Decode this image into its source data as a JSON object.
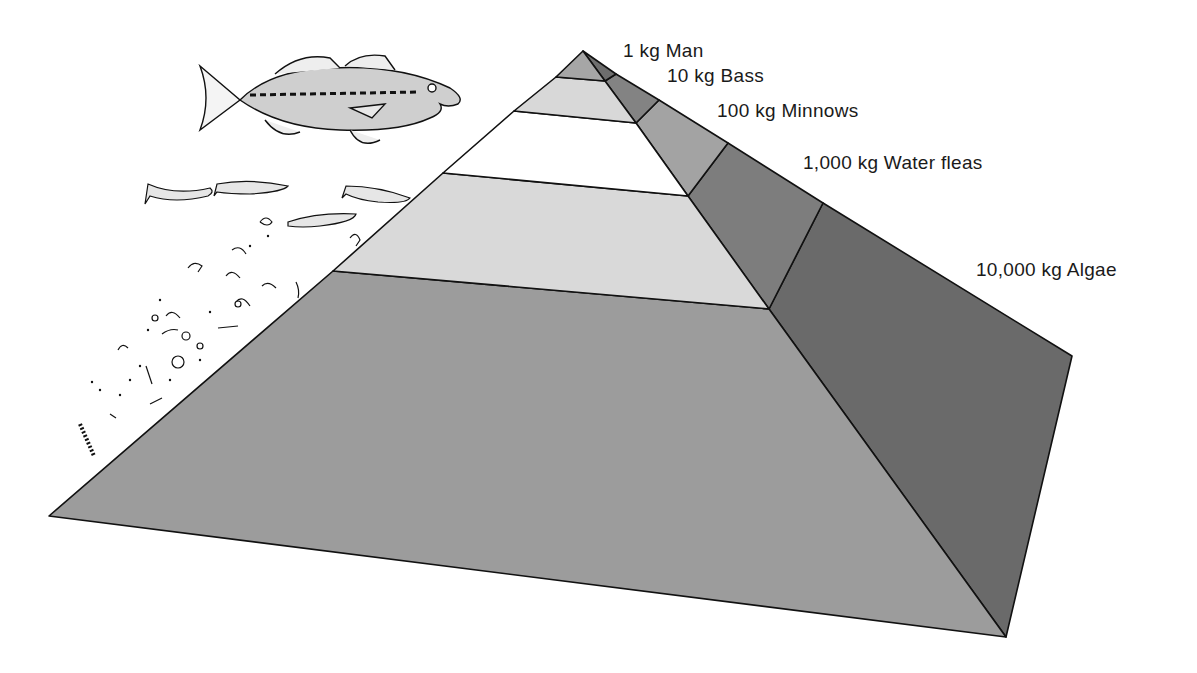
{
  "levels": [
    {
      "mass": "1 kg",
      "organism": "Man",
      "label": "1 kg Man",
      "front_color": "#a6a6a6",
      "side_color": "#6e6e6e"
    },
    {
      "mass": "10 kg",
      "organism": "Bass",
      "label": "10 kg Bass",
      "front_color": "#d8d8d8",
      "side_color": "#838383"
    },
    {
      "mass": "100 kg",
      "organism": "Minnows",
      "label": "100 kg Minnows",
      "front_color": "#ffffff",
      "side_color": "#a3a3a3"
    },
    {
      "mass": "1,000 kg",
      "organism": "Water fleas",
      "label": "1,000 kg Water fleas",
      "front_color": "#d9d9d9",
      "side_color": "#7d7d7d"
    },
    {
      "mass": "10,000 kg",
      "organism": "Algae",
      "label": "10,000 kg Algae",
      "front_color": "#9c9c9c",
      "side_color": "#6a6a6a"
    }
  ],
  "illustrations": {
    "top": "largemouth-bass",
    "middle": "minnows",
    "lower": "water-fleas",
    "bottom": "algae-plankton"
  }
}
